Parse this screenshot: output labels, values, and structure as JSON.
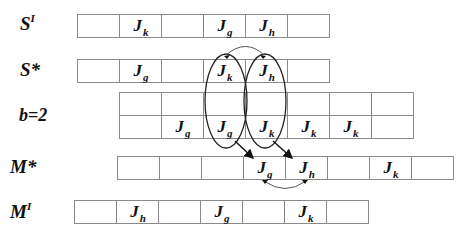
{
  "rows": {
    "SI": {
      "label": "S",
      "sup": "I",
      "cells": [
        "",
        "J|k",
        "",
        "J|g",
        "J|h",
        ""
      ]
    },
    "Sstar": {
      "label": "S*",
      "sup": "",
      "cells": [
        "",
        "J|g",
        "",
        "J|k",
        "J|h",
        ""
      ]
    },
    "b2": {
      "label": "b=2",
      "top": [
        "",
        "",
        "",
        "",
        "",
        "",
        ""
      ],
      "bottom": [
        "",
        "J|g",
        "J|g",
        "J|k",
        "J|k",
        "J|k",
        ""
      ]
    },
    "Mstar": {
      "label": "M*",
      "sup": "",
      "cells": [
        "",
        "",
        "",
        "J|g",
        "J|h",
        "",
        "J|k",
        ""
      ]
    },
    "MI": {
      "label": "M",
      "sup": "I",
      "cells": [
        "",
        "J|h",
        "",
        "J|g",
        "",
        "J|k",
        ""
      ]
    }
  },
  "annotations": {
    "ellipses": [
      "encircle J_k (S*) with J_g (b=2)",
      "encircle J_h (S*) with J_k (b=2)"
    ],
    "arrows": [
      "ellipse 1 -> M* J_g",
      "ellipse 2 -> M* J_h",
      "swap arc S* J_k <-> J_h",
      "swap arc M* J_g <-> J_h"
    ]
  }
}
